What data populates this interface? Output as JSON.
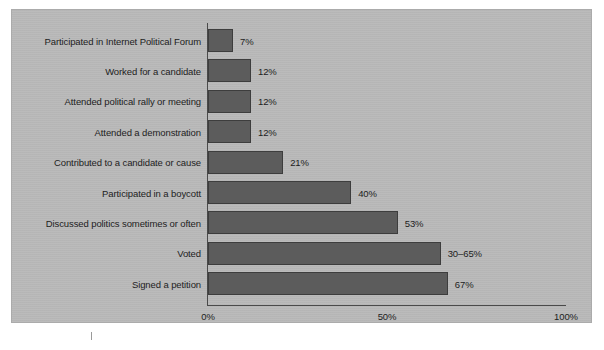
{
  "chart_data": {
    "type": "bar",
    "orientation": "horizontal",
    "title": "",
    "subtitle": "",
    "xlabel": "",
    "ylabel": "",
    "xlim": [
      0,
      100
    ],
    "grid": false,
    "legend": null,
    "xticks": [
      "0%",
      "50%",
      "100%"
    ],
    "xtick_values": [
      0,
      50,
      100
    ],
    "categories": [
      "Participated in Internet Political Forum",
      "Worked for a candidate",
      "Attended political rally or meeting",
      "Attended a demonstration",
      "Contributed to a candidate or cause",
      "Participated in a boycott",
      "Discussed politics sometimes or often",
      "Voted",
      "Signed a petition"
    ],
    "values": [
      7,
      12,
      12,
      12,
      21,
      40,
      53,
      65,
      67
    ],
    "value_labels": [
      "7%",
      "12%",
      "12%",
      "12%",
      "21%",
      "40%",
      "53%",
      "30–65%",
      "67%"
    ],
    "bar_color": "#5c5c5c",
    "bar_edge_color": "#3d3d3d",
    "background_color": "#b9b9b9",
    "axis_color": "#4a4a4a",
    "text_color": "#1d1d1d"
  }
}
